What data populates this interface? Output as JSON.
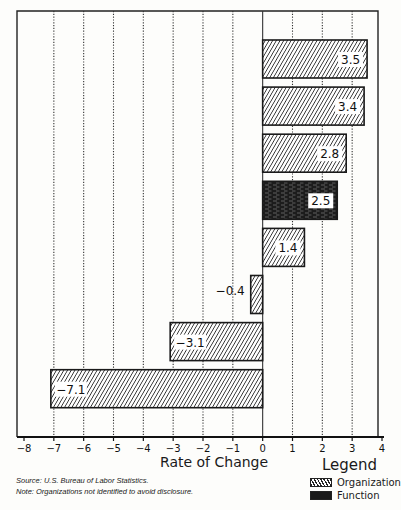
{
  "chart_data": {
    "type": "bar",
    "orientation": "horizontal",
    "title": "",
    "xlabel": "Rate of Change",
    "ylabel": "",
    "xlim": [
      -8,
      4
    ],
    "xticks": [
      -8,
      -7,
      -6,
      -5,
      -4,
      -3,
      -2,
      -1,
      0,
      1,
      2,
      3,
      4
    ],
    "grid": "vertical dotted",
    "categories": [
      "",
      "",
      "",
      "",
      "",
      "",
      "",
      ""
    ],
    "values": [
      3.5,
      3.4,
      2.8,
      2.5,
      1.4,
      -0.4,
      -3.1,
      -7.1
    ],
    "value_labels": [
      "3.5",
      "3.4",
      "2.8",
      "2.5",
      "1.4",
      "−0.4",
      "−3.1",
      "−7.1"
    ],
    "series_type": [
      "Organization",
      "Organization",
      "Organization",
      "Function",
      "Organization",
      "Organization",
      "Organization",
      "Organization"
    ],
    "legend": {
      "title": "Legend",
      "position": "bottom-right",
      "entries": [
        {
          "label": "Organization",
          "pattern": "diagonal-hatch"
        },
        {
          "label": "Function",
          "pattern": "solid-dark"
        }
      ]
    }
  },
  "axis": {
    "title": "Rate of Change",
    "tick_labels": [
      "−8",
      "−7",
      "−6",
      "−5",
      "−4",
      "−3",
      "−2",
      "−1",
      "0",
      "1",
      "2",
      "3",
      "4"
    ]
  },
  "notes": {
    "source": "Source: U.S. Bureau of Labor Statistics.",
    "note": "Note: Organizations not identified to avoid disclosure."
  },
  "legend": {
    "title": "Legend",
    "organization": "Organization",
    "function": "Function"
  }
}
